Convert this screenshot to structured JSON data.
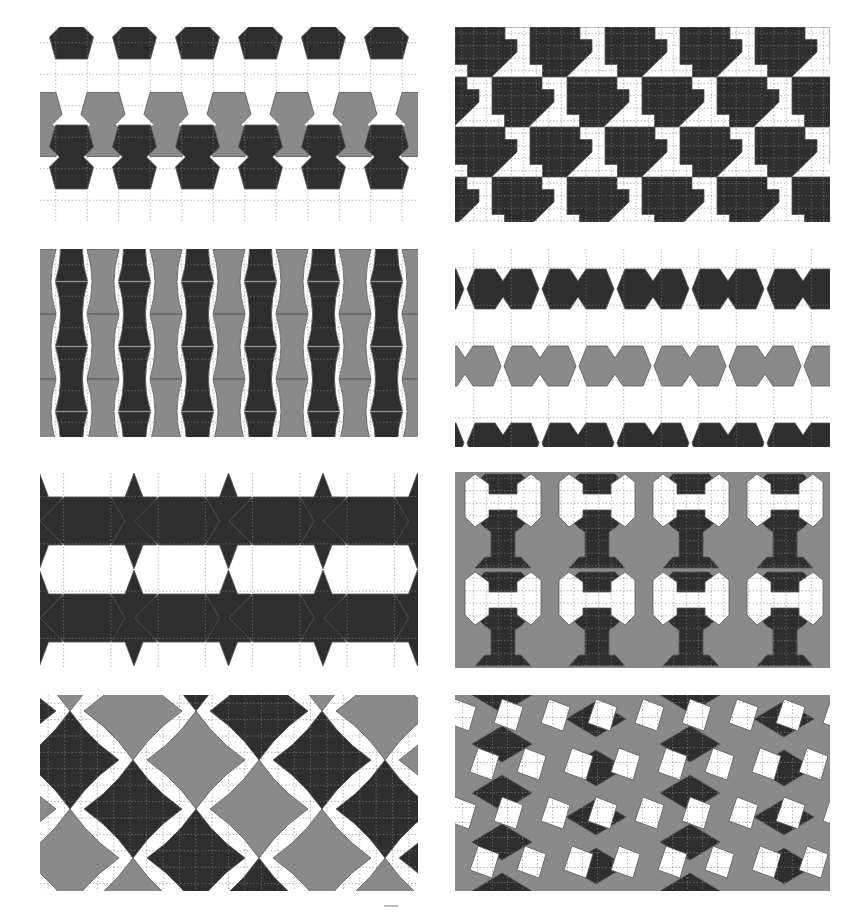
{
  "figure": {
    "colors": {
      "dark": "#2e2e2e",
      "mid": "#8a8a8a",
      "light": "#ffffff",
      "grid": "#888888",
      "outline": "#555555"
    }
  },
  "panels": [
    {
      "id": "p1",
      "name": "bowtie-pentagon-tiling",
      "x": 40,
      "y": 27,
      "w": 378,
      "h": 195,
      "cell": 31.5,
      "grid_cols": 12,
      "grid_rows": 6
    },
    {
      "id": "p2",
      "name": "square-arrow-tiling",
      "x": 455,
      "y": 27,
      "w": 375,
      "h": 195,
      "cell": 12.5,
      "grid_cols": 30,
      "grid_rows": 16
    },
    {
      "id": "p3",
      "name": "curved-bowtie-tiling",
      "x": 40,
      "y": 249,
      "w": 378,
      "h": 188,
      "cell": 31.5,
      "grid_cols": 12,
      "grid_rows": 6
    },
    {
      "id": "p4",
      "name": "cross-star-tiling",
      "x": 455,
      "y": 249,
      "w": 375,
      "h": 198,
      "cell": 37.5,
      "grid_cols": 10,
      "grid_rows": 5
    },
    {
      "id": "p5",
      "name": "star-hexagon-tiling",
      "x": 40,
      "y": 473,
      "w": 378,
      "h": 194,
      "cell": 47.25,
      "grid_cols": 8,
      "grid_rows": 4
    },
    {
      "id": "p6",
      "name": "bone-tiling",
      "x": 455,
      "y": 472,
      "w": 375,
      "h": 196,
      "cell": 12.5,
      "grid_cols": 30,
      "grid_rows": 16
    },
    {
      "id": "p7",
      "name": "octagon-star-tiling",
      "x": 40,
      "y": 695,
      "w": 378,
      "h": 196,
      "cell": 16.4,
      "grid_cols": 23,
      "grid_rows": 12
    },
    {
      "id": "p8",
      "name": "square-rhombus-tiling",
      "x": 455,
      "y": 695,
      "w": 375,
      "h": 196,
      "cell": 15,
      "grid_cols": 25,
      "grid_rows": 13
    }
  ]
}
